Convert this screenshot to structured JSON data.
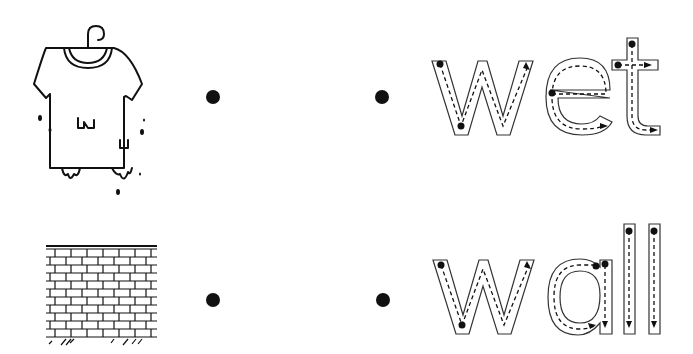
{
  "worksheet": {
    "type": "match-and-trace",
    "rows": [
      {
        "picture": "wet-tshirt-on-hanger",
        "word": "wet",
        "letters": [
          {
            "char": "w",
            "strokes": [
              "1",
              "2"
            ]
          },
          {
            "char": "e",
            "strokes": [
              "1"
            ]
          },
          {
            "char": "t",
            "strokes": [
              "1",
              "2"
            ]
          }
        ]
      },
      {
        "picture": "brick-wall",
        "word": "wall",
        "letters": [
          {
            "char": "w",
            "strokes": [
              "1",
              "2"
            ]
          },
          {
            "char": "a",
            "strokes": [
              "1",
              "2"
            ]
          },
          {
            "char": "l",
            "strokes": [
              "1"
            ]
          },
          {
            "char": "l",
            "strokes": [
              "1"
            ]
          }
        ]
      }
    ],
    "colors": {
      "ink": "#111111",
      "background": "#ffffff"
    }
  }
}
